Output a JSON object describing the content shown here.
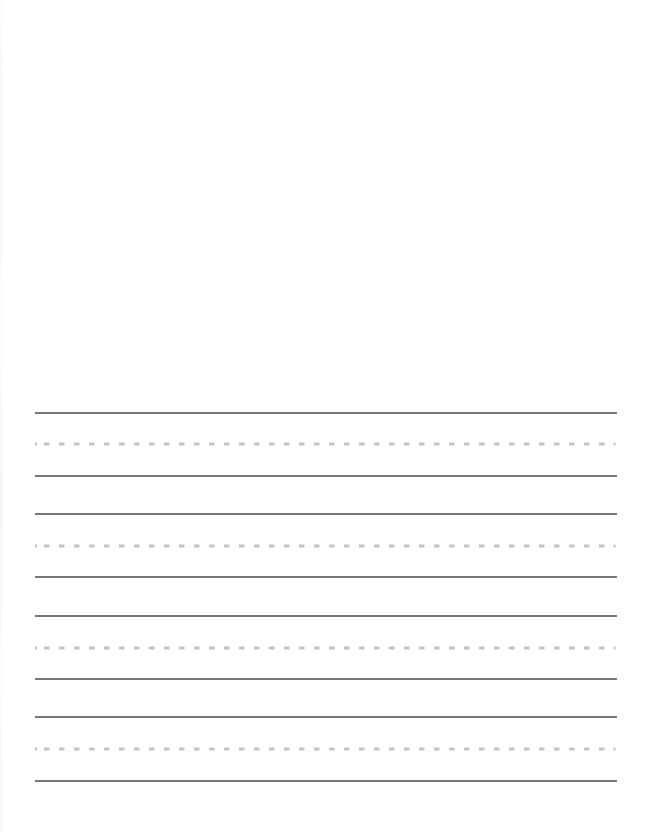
{
  "page": {
    "type": "handwriting practice paper",
    "background_color": "#ffffff"
  },
  "writing_area": {
    "line_sets": [
      {
        "index": 1,
        "top_y": 413,
        "mid_y": 444,
        "bottom_y": 476
      },
      {
        "index": 2,
        "top_y": 514,
        "mid_y": 546,
        "bottom_y": 577
      },
      {
        "index": 3,
        "top_y": 616,
        "mid_y": 648,
        "bottom_y": 679
      },
      {
        "index": 4,
        "top_y": 717,
        "mid_y": 749,
        "bottom_y": 781
      }
    ],
    "line_start_x": 35,
    "line_end_x": 617,
    "solid_line_color": "#4a4a4a",
    "dashed_line_color": "#c4c4c4"
  }
}
